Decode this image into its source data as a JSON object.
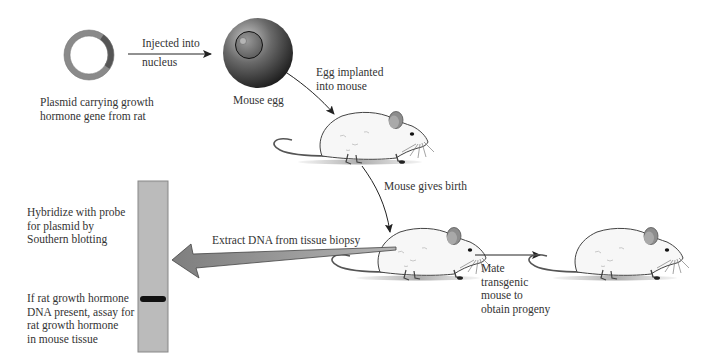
{
  "figure": {
    "type": "process-diagram"
  },
  "nodes": {
    "plasmid": {
      "label_lines": [
        "Plasmid carrying growth",
        "hormone gene from rat"
      ]
    },
    "egg": {
      "label": "Mouse egg"
    },
    "mouse_implanted": {
      "label": ""
    },
    "mouse_newborn": {
      "label": ""
    },
    "mouse_progeny": {
      "label": ""
    },
    "gel": {
      "label_top_lines": [
        "Hybridize with probe",
        "for plasmid by",
        "Southern blotting"
      ],
      "label_bottom_lines": [
        "If  rat growth hormone",
        "DNA present, assay  for",
        "rat growth hormone",
        "in mouse tissue"
      ]
    }
  },
  "edges": {
    "plasmid_to_egg": {
      "label_lines": [
        "Injected into",
        "nucleus"
      ]
    },
    "egg_to_mouse": {
      "label_lines": [
        "Egg implanted",
        "into mouse"
      ]
    },
    "mouse_to_newborn": {
      "label": "Mouse gives birth"
    },
    "newborn_to_gel": {
      "label": "Extract DNA from tissue biopsy"
    },
    "newborn_to_progeny": {
      "label_lines": [
        "Mate",
        "transgenic",
        "mouse to",
        "obtain progeny"
      ]
    }
  },
  "colors": {
    "plasmid_ring": "#8a8a8a",
    "plasmid_insert": "#555555",
    "egg_dark": "#222222",
    "egg_light": "#b0b0b0",
    "gel_fill": "#b8b8b8",
    "gel_band": "#111111",
    "big_arrow": "#8c8c8c",
    "mouse_body": "#f7f7f7",
    "mouse_ear": "#8d8d8d"
  }
}
